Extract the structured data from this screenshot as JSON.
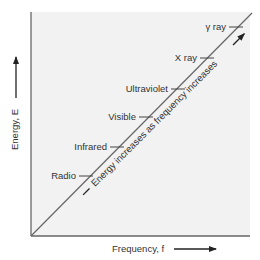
{
  "diagram": {
    "title": "",
    "y_axis_label": "Energy, E",
    "x_axis_label": "Frequency, f",
    "diagonal_annotation": "Energy increases as frequency increases",
    "regions": [
      {
        "label": "Radio",
        "x": 86,
        "y": 176
      },
      {
        "label": "Infrared",
        "x": 117,
        "y": 147
      },
      {
        "label": "Visible",
        "x": 146,
        "y": 117
      },
      {
        "label": "Ultraviolet",
        "x": 178,
        "y": 89
      },
      {
        "label": "X ray",
        "x": 207,
        "y": 58
      },
      {
        "label": "γ ray",
        "x": 236,
        "y": 27
      }
    ],
    "colors": {
      "plot_background": "#f2f2f2",
      "axis": "#666666",
      "text": "#333333"
    }
  }
}
